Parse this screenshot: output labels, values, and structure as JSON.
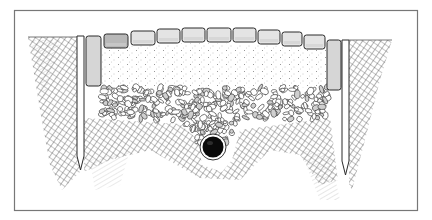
{
  "figure": {
    "title": "Cross-section of a paved path with edge restraints and drainage pipe",
    "frame": {
      "x": 14,
      "y": 10,
      "width": 404,
      "height": 201,
      "stroke": "#777777"
    },
    "colors": {
      "ink": "#2a2a2a",
      "hatch": "#555555",
      "paver_fill": "#e4e4e4",
      "paver_dark": "#b8b8b8",
      "curb_fill": "#d6d6d6",
      "sand": "#ffffff",
      "pipe": "#0a0a0a"
    },
    "layers": [
      {
        "name": "paver-layer",
        "label": "Pavers"
      },
      {
        "name": "sand-bedding-layer",
        "label": "Sand bedding"
      },
      {
        "name": "gravel-base-layer",
        "label": "Gravel base"
      },
      {
        "name": "soil-layer",
        "label": "Subsoil"
      }
    ],
    "pavers": [
      {
        "x": 104,
        "y": 34,
        "w": 24,
        "h": 14,
        "shade": "dark"
      },
      {
        "x": 131,
        "y": 31,
        "w": 24,
        "h": 14,
        "shade": "light"
      },
      {
        "x": 157,
        "y": 29,
        "w": 23,
        "h": 14,
        "shade": "light"
      },
      {
        "x": 182,
        "y": 28,
        "w": 23,
        "h": 14,
        "shade": "light"
      },
      {
        "x": 207,
        "y": 28,
        "w": 24,
        "h": 14,
        "shade": "light"
      },
      {
        "x": 233,
        "y": 28,
        "w": 23,
        "h": 14,
        "shade": "light"
      },
      {
        "x": 258,
        "y": 30,
        "w": 22,
        "h": 14,
        "shade": "light"
      },
      {
        "x": 282,
        "y": 32,
        "w": 20,
        "h": 14,
        "shade": "light"
      },
      {
        "x": 304,
        "y": 35,
        "w": 21,
        "h": 14,
        "shade": "light"
      }
    ],
    "curbs": [
      {
        "side": "left",
        "x": 86,
        "y": 36,
        "w": 15,
        "h": 50
      },
      {
        "side": "right",
        "x": 327,
        "y": 40,
        "w": 14,
        "h": 50
      }
    ],
    "stakes": [
      {
        "side": "left",
        "x": 77,
        "top": 36,
        "w": 7,
        "tip": 170
      },
      {
        "side": "right",
        "x": 342,
        "top": 40,
        "w": 7,
        "tip": 175
      }
    ],
    "drain_pipe": {
      "cx": 213,
      "cy": 147,
      "r": 11
    }
  }
}
